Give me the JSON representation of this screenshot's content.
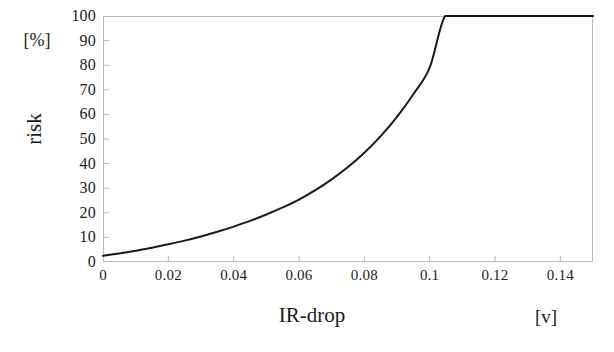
{
  "chart_data": {
    "type": "line",
    "title": "",
    "xlabel": "IR-drop",
    "xunit": "[v]",
    "ylabel": "risk",
    "yunit": "[%]",
    "xlim": [
      0,
      0.15
    ],
    "ylim": [
      0,
      100
    ],
    "grid": false,
    "legend": null,
    "line_color": "#1a1a1a",
    "frame_color": "#b9b9b9",
    "xticks": [
      {
        "value": 0,
        "label": "0"
      },
      {
        "value": 0.02,
        "label": "0.02"
      },
      {
        "value": 0.04,
        "label": "0.04"
      },
      {
        "value": 0.06,
        "label": "0.06"
      },
      {
        "value": 0.08,
        "label": "0.08"
      },
      {
        "value": 0.1,
        "label": "0.1"
      },
      {
        "value": 0.12,
        "label": "0.12"
      },
      {
        "value": 0.14,
        "label": "0.14"
      }
    ],
    "yticks": [
      {
        "value": 0,
        "label": "0"
      },
      {
        "value": 10,
        "label": "10"
      },
      {
        "value": 20,
        "label": "20"
      },
      {
        "value": 30,
        "label": "30"
      },
      {
        "value": 40,
        "label": "40"
      },
      {
        "value": 50,
        "label": "50"
      },
      {
        "value": 60,
        "label": "60"
      },
      {
        "value": 70,
        "label": "70"
      },
      {
        "value": 80,
        "label": "80"
      },
      {
        "value": 90,
        "label": "90"
      },
      {
        "value": 100,
        "label": "100"
      }
    ],
    "series": [
      {
        "name": "risk",
        "saturation_x": 0.105,
        "x": [
          0.0,
          0.005,
          0.01,
          0.015,
          0.02,
          0.025,
          0.03,
          0.035,
          0.04,
          0.045,
          0.05,
          0.055,
          0.06,
          0.065,
          0.07,
          0.075,
          0.08,
          0.085,
          0.09,
          0.095,
          0.1,
          0.1047,
          0.11,
          0.115,
          0.12,
          0.125,
          0.13,
          0.135,
          0.14,
          0.145,
          0.15
        ],
        "y": [
          2.5,
          3.5,
          4.6,
          5.8,
          7.2,
          8.7,
          10.4,
          12.3,
          14.4,
          16.7,
          19.3,
          22.2,
          25.4,
          29.2,
          33.6,
          38.6,
          44.4,
          51.2,
          59.0,
          68.2,
          79.0,
          100.0,
          100.0,
          100.0,
          100.0,
          100.0,
          100.0,
          100.0,
          100.0,
          100.0,
          100.0
        ]
      }
    ]
  }
}
